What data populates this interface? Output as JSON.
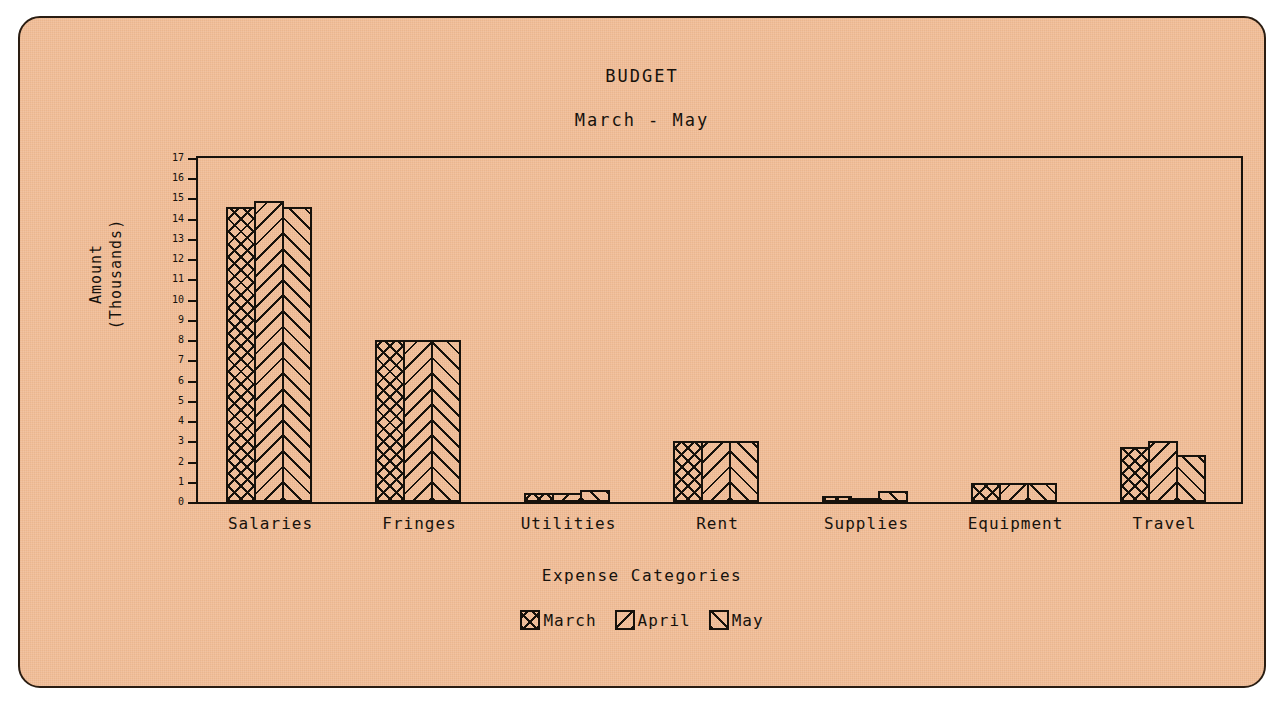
{
  "chart_data": {
    "type": "bar",
    "title": "BUDGET",
    "subtitle": "March - May",
    "xlabel": "Expense Categories",
    "ylabel": "Amount\n(Thousands)",
    "ylabel_line1": "Amount",
    "ylabel_line2": "(Thousands)",
    "ylim": [
      0,
      17
    ],
    "ytick_step": 1,
    "yticks": [
      0,
      1,
      2,
      3,
      4,
      5,
      6,
      7,
      8,
      9,
      10,
      11,
      12,
      13,
      14,
      15,
      16,
      17
    ],
    "ytick_labels": [
      "0",
      "1",
      "2",
      "3",
      "4",
      "5",
      "6",
      "7",
      "8",
      "9",
      "10",
      "11",
      "12",
      "13",
      "14",
      "15",
      "16",
      "17"
    ],
    "grid": false,
    "legend_position": "bottom",
    "categories": [
      "Salaries",
      "Fringes",
      "Utilities",
      "Rent",
      "Supplies",
      "Equipment",
      "Travel"
    ],
    "series": [
      {
        "name": "March",
        "pattern": "cross-hatch",
        "values": [
          14.6,
          8.0,
          0.45,
          3.0,
          0.3,
          0.95,
          2.7
        ]
      },
      {
        "name": "April",
        "pattern": "backslash-diagonal",
        "values": [
          14.9,
          8.0,
          0.45,
          3.0,
          0.2,
          0.95,
          3.0
        ]
      },
      {
        "name": "May",
        "pattern": "forward-slash-diagonal",
        "values": [
          14.6,
          8.0,
          0.6,
          3.0,
          0.55,
          0.95,
          2.3
        ]
      }
    ]
  },
  "legend": {
    "items": [
      {
        "label": "March"
      },
      {
        "label": "April"
      },
      {
        "label": "May"
      }
    ]
  },
  "colors": {
    "background": "#f2bd96",
    "ink": "#17120c",
    "page": "#ffffff"
  }
}
